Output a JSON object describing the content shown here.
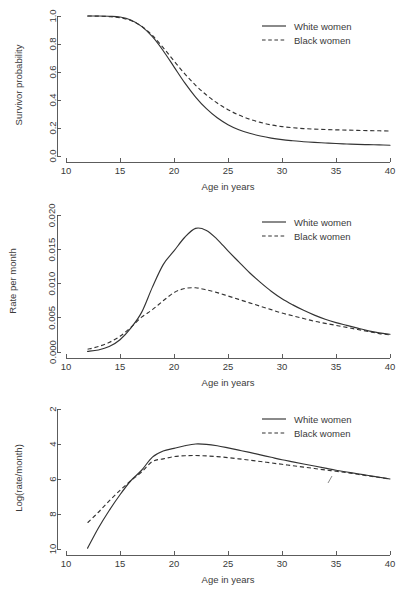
{
  "figure": {
    "background": "#ffffff",
    "line_color": "#333333",
    "axis_color": "#4a4a4a",
    "text_color": "#3a3a3a"
  },
  "shared": {
    "xlabel": "Age in years",
    "x_ticks": [
      "10",
      "15",
      "20",
      "25",
      "30",
      "35",
      "40"
    ],
    "legend": {
      "white": "White women",
      "black": "Black women"
    }
  },
  "chart_data": [
    {
      "id": "survivor-probability",
      "type": "line",
      "title": "",
      "xlabel": "Age in years",
      "ylabel": "Survivor probability",
      "xlim": [
        10,
        40
      ],
      "ylim": [
        0.0,
        1.0
      ],
      "x_ticks": [
        10,
        15,
        20,
        25,
        30,
        35,
        40
      ],
      "y_ticks": [
        0.0,
        0.2,
        0.4,
        0.6,
        0.8,
        1.0
      ],
      "y_tick_labels": [
        "0.0",
        "0.2",
        "0.4",
        "0.6",
        "0.8",
        "1.0"
      ],
      "grid": false,
      "legend_position": "top-right",
      "x": [
        12,
        13,
        14,
        15,
        16,
        17,
        18,
        19,
        20,
        21,
        22,
        23,
        24,
        25,
        26,
        27,
        28,
        29,
        30,
        31,
        32,
        33,
        34,
        35,
        36,
        37,
        38,
        39,
        40
      ],
      "series": [
        {
          "name": "White women",
          "style": "solid",
          "values": [
            1.0,
            1.0,
            0.998,
            0.993,
            0.972,
            0.926,
            0.852,
            0.752,
            0.637,
            0.522,
            0.421,
            0.338,
            0.273,
            0.224,
            0.188,
            0.162,
            0.143,
            0.128,
            0.117,
            0.109,
            0.102,
            0.097,
            0.093,
            0.089,
            0.086,
            0.083,
            0.081,
            0.079,
            0.077
          ]
        },
        {
          "name": "Black women",
          "style": "dashed",
          "values": [
            1.0,
            0.999,
            0.996,
            0.988,
            0.968,
            0.927,
            0.861,
            0.774,
            0.679,
            0.587,
            0.505,
            0.436,
            0.378,
            0.331,
            0.293,
            0.263,
            0.24,
            0.222,
            0.21,
            0.202,
            0.196,
            0.192,
            0.189,
            0.187,
            0.185,
            0.183,
            0.181,
            0.18,
            0.178
          ]
        }
      ]
    },
    {
      "id": "rate-per-month",
      "type": "line",
      "title": "",
      "xlabel": "Age in years",
      "ylabel": "Rate per month",
      "xlim": [
        10,
        40
      ],
      "ylim": [
        0.0,
        0.0205
      ],
      "x_ticks": [
        10,
        15,
        20,
        25,
        30,
        35,
        40
      ],
      "y_ticks": [
        0.0,
        0.005,
        0.01,
        0.015,
        0.02
      ],
      "y_tick_labels": [
        "0.000",
        "0.005",
        "0.010",
        "0.015",
        "0.020"
      ],
      "grid": false,
      "legend_position": "top-right",
      "x": [
        12,
        13,
        14,
        15,
        16,
        17,
        18,
        19,
        20,
        21,
        22,
        23,
        24,
        25,
        26,
        27,
        28,
        29,
        30,
        31,
        32,
        33,
        34,
        35,
        36,
        37,
        38,
        39,
        40
      ],
      "series": [
        {
          "name": "White women",
          "style": "solid",
          "values": [
            0.0001,
            0.0003,
            0.0008,
            0.0018,
            0.0035,
            0.0058,
            0.0095,
            0.0128,
            0.0148,
            0.0168,
            0.0181,
            0.0178,
            0.0165,
            0.0148,
            0.0132,
            0.0116,
            0.0102,
            0.0089,
            0.0078,
            0.0069,
            0.0061,
            0.0054,
            0.0048,
            0.0043,
            0.0039,
            0.0035,
            0.0031,
            0.0028,
            0.0026
          ]
        },
        {
          "name": "Black women",
          "style": "dashed",
          "values": [
            0.0004,
            0.0008,
            0.0014,
            0.0023,
            0.0036,
            0.0051,
            0.0062,
            0.0075,
            0.0087,
            0.0093,
            0.0094,
            0.0091,
            0.0087,
            0.0082,
            0.0077,
            0.0072,
            0.0067,
            0.0062,
            0.0057,
            0.0053,
            0.0049,
            0.0045,
            0.0042,
            0.0039,
            0.0036,
            0.0033,
            0.003,
            0.0027,
            0.0025
          ]
        }
      ]
    },
    {
      "id": "log-rate-per-month",
      "type": "line",
      "title": "",
      "xlabel": "Age in years",
      "ylabel": "Log(rate/month)",
      "xlim": [
        10,
        40
      ],
      "ylim": [
        10,
        2
      ],
      "axis_inverted": true,
      "x_ticks": [
        10,
        15,
        20,
        25,
        30,
        35,
        40
      ],
      "y_ticks": [
        2,
        4,
        6,
        8,
        10
      ],
      "y_tick_labels": [
        "2",
        "4",
        "6",
        "8",
        "10"
      ],
      "grid": false,
      "legend_position": "top-right",
      "x": [
        12,
        13,
        14,
        15,
        16,
        17,
        18,
        19,
        20,
        21,
        22,
        23,
        24,
        25,
        26,
        27,
        28,
        29,
        30,
        31,
        32,
        33,
        34,
        35,
        36,
        37,
        38,
        39,
        40
      ],
      "series": [
        {
          "name": "White women",
          "style": "solid",
          "values": [
            9.95,
            8.8,
            7.8,
            6.9,
            6.1,
            5.5,
            4.75,
            4.4,
            4.25,
            4.1,
            4.0,
            4.02,
            4.1,
            4.22,
            4.35,
            4.48,
            4.62,
            4.76,
            4.9,
            5.02,
            5.14,
            5.26,
            5.38,
            5.5,
            5.6,
            5.7,
            5.8,
            5.9,
            6.0
          ]
        },
        {
          "name": "Black women",
          "style": "dashed",
          "values": [
            8.5,
            7.9,
            7.25,
            6.65,
            6.1,
            5.6,
            5.0,
            4.85,
            4.72,
            4.67,
            4.66,
            4.68,
            4.72,
            4.78,
            4.85,
            4.92,
            5.0,
            5.08,
            5.16,
            5.24,
            5.32,
            5.4,
            5.48,
            5.56,
            5.64,
            5.73,
            5.82,
            5.91,
            6.0
          ]
        }
      ]
    }
  ]
}
